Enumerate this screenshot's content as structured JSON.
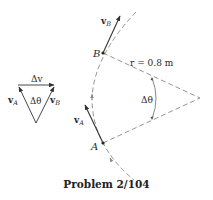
{
  "caption": "Problem 2/104",
  "labels": {
    "vB": {
      "main": "v",
      "sub": "B"
    },
    "vA": {
      "main": "v",
      "sub": "A"
    },
    "pointB": "B",
    "pointA": "A",
    "radius": "r = 0.8 m",
    "angle": "Δθ",
    "triangle": {
      "dv": "Δv",
      "vA": {
        "main": "v",
        "sub": "A"
      },
      "vB": {
        "main": "v",
        "sub": "B"
      },
      "angle": "Δθ"
    }
  },
  "colors": {
    "line": "#333333",
    "dashed": "#888888",
    "text": "#2a2a2a"
  }
}
